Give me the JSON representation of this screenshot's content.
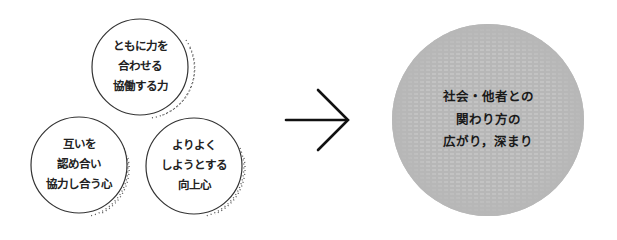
{
  "diagram": {
    "circles": [
      {
        "id": "top",
        "lines": [
          "ともに力を",
          "合わせる",
          "協働する力"
        ]
      },
      {
        "id": "bottom-left",
        "lines": [
          "互いを",
          "認め合い",
          "協力し合う心"
        ]
      },
      {
        "id": "bottom-right",
        "lines": [
          "よりよく",
          "しようとする",
          "向上心"
        ]
      }
    ],
    "arrow": {
      "icon": "right-arrow-icon"
    },
    "result": {
      "lines": [
        "社会・他者との",
        "関わり方の",
        "広がり，深まり"
      ]
    },
    "colors": {
      "result_fill": "#b8b8b8",
      "stroke": "#333333",
      "background": "#ffffff"
    }
  }
}
